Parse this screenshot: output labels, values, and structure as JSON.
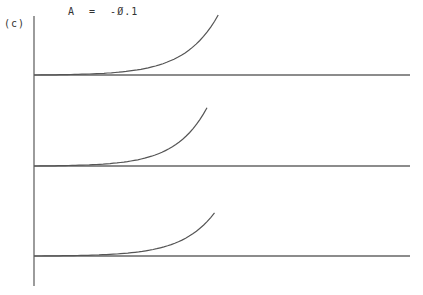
{
  "chart_data": {
    "type": "line",
    "panel_label": "(c)",
    "annotation": "A  =  -Ø.1",
    "title": "",
    "xlabel": "",
    "ylabel": "",
    "grid": false,
    "legend": "none",
    "x_range": [
      0,
      1
    ],
    "y_range_per_trace": [
      0,
      1
    ],
    "series": [
      {
        "name": "trace-1",
        "curve_end_x": 0.49,
        "curve_end_y": 1.0,
        "shape": "exponential-rise"
      },
      {
        "name": "trace-2",
        "curve_end_x": 0.46,
        "curve_end_y": 0.97,
        "shape": "exponential-rise"
      },
      {
        "name": "trace-3",
        "curve_end_x": 0.48,
        "curve_end_y": 0.72,
        "shape": "exponential-rise"
      }
    ]
  }
}
